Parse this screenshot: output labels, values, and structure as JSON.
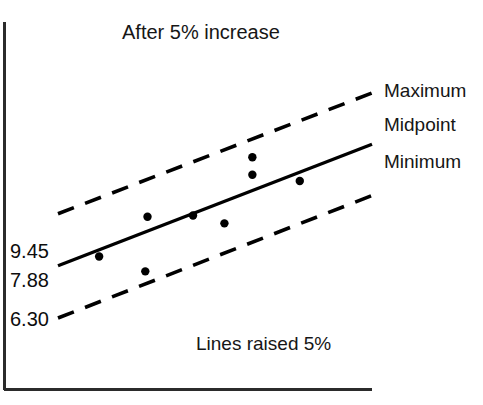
{
  "chart_data": {
    "type": "scatter",
    "title": "After 5% increase",
    "xlabel": "Lines raised 5%",
    "ylabel": "",
    "caption": "Lines raised 5%",
    "grid": false,
    "legend_position": "right",
    "ytick_labels": [
      "9.45",
      "7.88",
      "6.30"
    ],
    "ytick_values": [
      9.45,
      7.88,
      6.3
    ],
    "xtick_labels": [],
    "series": [
      {
        "name": "Maximum",
        "type": "line",
        "style": "dashed",
        "color": "#000000",
        "x": [
          0.0,
          1.0
        ],
        "y": [
          9.45,
          13.1
        ]
      },
      {
        "name": "Midpoint",
        "type": "line",
        "style": "solid",
        "color": "#000000",
        "x": [
          0.0,
          1.0
        ],
        "y": [
          7.88,
          11.55
        ]
      },
      {
        "name": "Minimum",
        "type": "line",
        "style": "dashed",
        "color": "#000000",
        "x": [
          0.0,
          1.0
        ],
        "y": [
          6.3,
          10.0
        ]
      },
      {
        "name": "Observations",
        "type": "scatter",
        "color": "#000000",
        "points": [
          {
            "x": 0.131,
            "y": 8.16
          },
          {
            "x": 0.278,
            "y": 7.71
          },
          {
            "x": 0.285,
            "y": 9.36
          },
          {
            "x": 0.43,
            "y": 9.4
          },
          {
            "x": 0.53,
            "y": 9.16
          },
          {
            "x": 0.619,
            "y": 11.16
          },
          {
            "x": 0.619,
            "y": 10.63
          },
          {
            "x": 0.77,
            "y": 10.44
          }
        ]
      }
    ]
  },
  "axes": {
    "y_axis_name": "value-axis",
    "x_axis_name": "category-axis"
  },
  "legend": {
    "items": [
      {
        "label": "Maximum",
        "style": "dashed"
      },
      {
        "label": "Midpoint",
        "style": "solid"
      },
      {
        "label": "Minimum",
        "style": "dashed"
      }
    ]
  }
}
